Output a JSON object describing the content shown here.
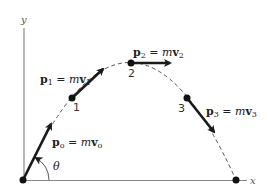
{
  "diagram": {
    "axes": {
      "x_label": "x",
      "y_label": "y"
    },
    "angle_label": "θ",
    "points": [
      {
        "id": "0",
        "label": ""
      },
      {
        "id": "1",
        "label": "1"
      },
      {
        "id": "2",
        "label": "2"
      },
      {
        "id": "3",
        "label": "3"
      },
      {
        "id": "end",
        "label": ""
      }
    ],
    "vectors": [
      {
        "name": "p0",
        "bold": "p",
        "sub": "o",
        "eq": " = ",
        "m": "m",
        "vbold": "v",
        "vsub": "o"
      },
      {
        "name": "p1",
        "bold": "p",
        "sub": "1",
        "eq": " = ",
        "m": "m",
        "vbold": "v",
        "vsub": "1"
      },
      {
        "name": "p2",
        "bold": "p",
        "sub": "2",
        "eq": " = ",
        "m": "m",
        "vbold": "v",
        "vsub": "2"
      },
      {
        "name": "p3",
        "bold": "p",
        "sub": "3",
        "eq": " = ",
        "m": "m",
        "vbold": "v",
        "vsub": "3"
      }
    ],
    "colors": {
      "ink": "#1a1a1a",
      "axis": "#777777",
      "trajectory": "#555555"
    }
  }
}
